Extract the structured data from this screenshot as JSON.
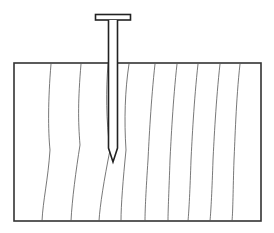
{
  "diagram": {
    "title": "Nail driven into wood block",
    "colors": {
      "background": "#ffffff",
      "outline": "#333333",
      "grain": "#555555",
      "nail_fill": "#ffffff",
      "nail_outline": "#222222"
    },
    "block": {
      "x": 14,
      "y": 63,
      "width": 247,
      "height": 158
    },
    "nail": {
      "head": {
        "x": 95,
        "y": 14,
        "width": 36,
        "height": 6
      },
      "shank": {
        "x": 108,
        "width": 10,
        "top": 20,
        "tip_start": 148,
        "tip": 162
      }
    },
    "grain_lines": [
      "M51,64 C48,100 48,130 50,150 C48,180 43,200 42,221",
      "M81,64 C78,100 78,120 80,145 C76,170 72,200 71,221",
      "M108,64 C106,90 106,120 110,150 C104,180 100,205 99,221",
      "M129,64 C125,90 124,120 126,150 C123,180 121,205 121,221",
      "M155,64 C151,100 149,140 148,160 C146,190 145,210 145,221",
      "M177,64 C173,100 171,140 170,160 C169,190 168,210 168,221",
      "M198,64 C194,100 192,140 191,160 C190,190 189,210 188,221",
      "M220,64 C216,100 214,140 213,160 C212,190 211,210 210,221",
      "M240,64 C236,100 235,140 234,160 C233,190 233,210 232,221"
    ]
  }
}
